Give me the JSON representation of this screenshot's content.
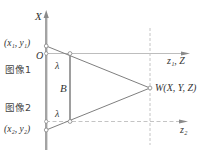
{
  "diagram": {
    "axes": {
      "x_axis_label": "X",
      "z1_axis_label": "z₁, Z",
      "z2_axis_label": "z₂"
    },
    "points": {
      "image1_point": "(x₁, y₁)",
      "origin": "O",
      "image2_point": "(x₂, y₂)",
      "world_point": "W(X, Y, Z)"
    },
    "labels": {
      "lambda_top": "λ",
      "baseline": "B",
      "lambda_bottom": "λ",
      "image1": "图像1",
      "image2": "图像2"
    },
    "colors": {
      "axis_bar": "#9a9a9a",
      "line": "#777777",
      "dashed": "#b0b0b0",
      "text": "#333333"
    }
  }
}
